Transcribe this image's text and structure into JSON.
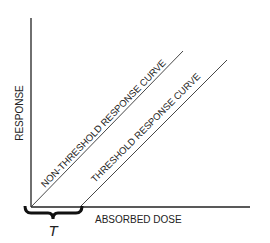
{
  "diagram": {
    "y_axis_label": "RESPONSE",
    "x_axis_label": "ABSORBED DOSE",
    "threshold_symbol": "T",
    "curves": [
      {
        "name": "non-threshold",
        "label": "NON-THRESHOLD RESPONSE CURVE"
      },
      {
        "name": "threshold",
        "label": "THRESHOLD RESPONSE CURVE"
      }
    ],
    "colors": {
      "line": "#222222",
      "background": "#ffffff"
    }
  }
}
